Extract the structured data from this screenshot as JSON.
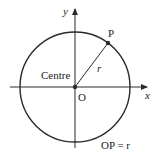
{
  "diagram": {
    "type": "circle-centred-at-origin",
    "colors": {
      "stroke": "#2a2a2a",
      "background": "#ffffff",
      "text": "#222222"
    },
    "axes": {
      "x_label": "x",
      "y_label": "y"
    },
    "points": {
      "origin_label": "O",
      "point_label": "P"
    },
    "labels": {
      "centre": "Centre",
      "radius": "r",
      "equation": "OP = r"
    }
  }
}
